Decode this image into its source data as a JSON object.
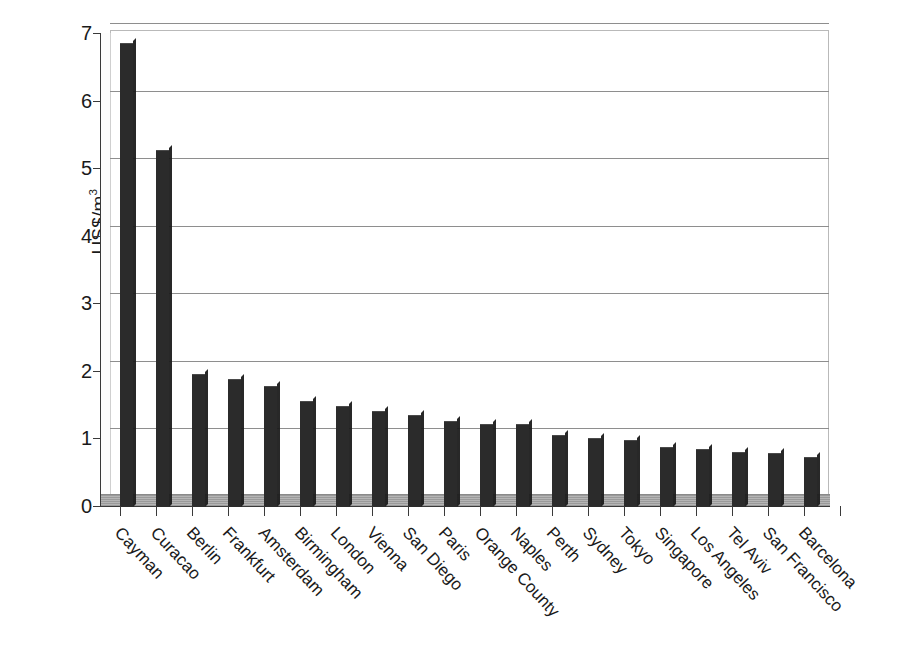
{
  "chart_data": {
    "type": "bar",
    "title": "",
    "subtitle": "",
    "xlabel": "",
    "ylabel": "US$/m",
    "ylabel_superscript": "3",
    "ylim": [
      0,
      7
    ],
    "yticks": [
      0,
      1,
      2,
      3,
      4,
      5,
      6,
      7
    ],
    "ytick_labels": [
      "0",
      "1",
      "2",
      "3",
      "4",
      "5",
      "6",
      "7"
    ],
    "grid": true,
    "grid_axis": "y",
    "legend": false,
    "legend_position": "none",
    "bar_color": "#2b2b2b",
    "categories": [
      "Cayman",
      "Curacao",
      "Berlin",
      "Frankfurt",
      "Amsterdam",
      "Birmingham",
      "London",
      "Vienna",
      "San Diego",
      "Paris",
      "Orange County",
      "Naples",
      "Perth",
      "Sydney",
      "Tokyo",
      "Singapore",
      "Los Angeles",
      "Tel Aviv",
      "San Francisco",
      "Barcelona"
    ],
    "values": [
      6.85,
      5.27,
      1.95,
      1.88,
      1.78,
      1.55,
      1.48,
      1.41,
      1.34,
      1.26,
      1.22,
      1.21,
      1.05,
      1.0,
      0.97,
      0.87,
      0.85,
      0.8,
      0.78,
      0.73
    ]
  }
}
